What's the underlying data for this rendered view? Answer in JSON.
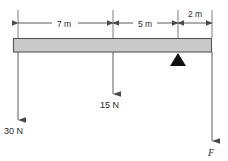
{
  "figure": {
    "type": "free-body-diagram",
    "background_color": "#ffffff",
    "line_color": "#4a4a4a",
    "text_color": "#2b2b2b"
  },
  "beam": {
    "name": "beam",
    "fill_color": "#c9c9c9",
    "border_color": "#555555",
    "x_left": 13,
    "x_right": 212,
    "y_top": 38,
    "y_bottom": 52
  },
  "dimensions": [
    {
      "label": "7 m",
      "value": 7,
      "unit": "m",
      "x_start": 18,
      "x_end": 113,
      "label_x": 64,
      "label_y": 26,
      "line_y": 23,
      "label_position": "inline"
    },
    {
      "label": "5 m",
      "value": 5,
      "unit": "m",
      "x_start": 113,
      "x_end": 178,
      "label_x": 144,
      "label_y": 26,
      "line_y": 23,
      "label_position": "inline"
    },
    {
      "label": "2 m",
      "value": 2,
      "unit": "m",
      "x_start": 178,
      "x_end": 212,
      "label_x": 195,
      "label_y": 16,
      "line_y": 23,
      "label_position": "above"
    }
  ],
  "forces": [
    {
      "name": "load-30N",
      "label": "30 N",
      "magnitude": 30,
      "unit": "N",
      "direction": "down",
      "x": 18,
      "y_start": 52,
      "y_end": 120,
      "label_x": 4,
      "label_y": 133
    },
    {
      "name": "load-15N",
      "label": "15 N",
      "magnitude": 15,
      "unit": "N",
      "direction": "down",
      "x": 113,
      "y_start": 52,
      "y_end": 94,
      "label_x": 100,
      "label_y": 107
    },
    {
      "name": "reaction-F",
      "label": "F",
      "magnitude": null,
      "unit": "N",
      "direction": "down",
      "x": 212,
      "y_start": 52,
      "y_end": 141,
      "label_x": 208,
      "label_y": 155,
      "italic": true
    }
  ],
  "fulcrum": {
    "name": "fulcrum-triangle",
    "x": 178,
    "y_apex": 53,
    "half_width": 8,
    "height": 13,
    "fill_color": "#111111"
  }
}
